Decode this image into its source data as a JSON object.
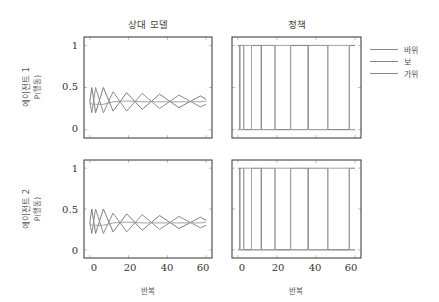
{
  "columns": {
    "left_title": "상대 모델",
    "right_title": "정책"
  },
  "rows": [
    {
      "label": "에이전트 1",
      "sublabel": "P(행동)"
    },
    {
      "label": "에이전트 2",
      "sublabel": "P(행동)"
    }
  ],
  "axes": {
    "y_ticks": [
      "1",
      "0.5",
      "0"
    ],
    "x_ticks": [
      "0",
      "20",
      "40",
      "60"
    ],
    "xlabel": "반복"
  },
  "legend": {
    "items": [
      {
        "label": "바위",
        "color": "#8a8a8a"
      },
      {
        "label": "보",
        "color": "#8a8a8a"
      },
      {
        "label": "가위",
        "color": "#8a8a8a"
      }
    ]
  },
  "chart_data": [
    {
      "type": "line",
      "title": "상대 모델",
      "row_label": "에이전트 1 P(행동)",
      "xlabel": "반복",
      "ylabel": "P(행동)",
      "xlim": [
        -3,
        63
      ],
      "ylim": [
        -0.1,
        1.1
      ],
      "x_ticks": [
        0,
        20,
        40,
        60
      ],
      "y_ticks": [
        0,
        0.5,
        1
      ],
      "grid": false,
      "legend_position": "right",
      "description": "Three opponent-model action probabilities oscillating around 1/3 with slowly decaying amplitude and increasing period (fictitious-play-like cycle).",
      "series": [
        {
          "name": "바위",
          "x": [
            0,
            1,
            3,
            7,
            12,
            19,
            27,
            36,
            46,
            57,
            60
          ],
          "y": [
            0.33,
            0.5,
            0.2,
            0.5,
            0.22,
            0.44,
            0.24,
            0.42,
            0.26,
            0.4,
            0.36
          ]
        },
        {
          "name": "보",
          "x": [
            0,
            1,
            3,
            7,
            12,
            19,
            27,
            36,
            46,
            57,
            60
          ],
          "y": [
            0.33,
            0.2,
            0.5,
            0.2,
            0.45,
            0.22,
            0.43,
            0.25,
            0.41,
            0.27,
            0.3
          ]
        },
        {
          "name": "가위",
          "x": [
            0,
            1,
            3,
            7,
            12,
            19,
            27,
            36,
            46,
            57,
            60
          ],
          "y": [
            0.33,
            0.3,
            0.3,
            0.3,
            0.33,
            0.34,
            0.33,
            0.33,
            0.33,
            0.33,
            0.34
          ]
        }
      ]
    },
    {
      "type": "line",
      "title": "정책",
      "row_label": "에이전트 1",
      "xlabel": "반복",
      "xlim": [
        -3,
        63
      ],
      "ylim": [
        -0.1,
        1.1
      ],
      "x_ticks": [
        0,
        20,
        40,
        60
      ],
      "y_ticks": [
        0,
        0.5,
        1
      ],
      "grid": false,
      "description": "Deterministic best-response policy: each action probability switches between 0 and 1; switch iterations approx.",
      "switch_iterations": [
        1,
        3,
        7,
        12,
        19,
        27,
        36,
        46,
        57
      ]
    },
    {
      "type": "line",
      "title": "상대 모델",
      "row_label": "에이전트 2 P(행동)",
      "xlabel": "반복",
      "ylabel": "P(행동)",
      "xlim": [
        -3,
        63
      ],
      "ylim": [
        -0.1,
        1.1
      ],
      "x_ticks": [
        0,
        20,
        40,
        60
      ],
      "y_ticks": [
        0,
        0.5,
        1
      ],
      "grid": false,
      "series": [
        {
          "name": "바위",
          "x": [
            0,
            1,
            3,
            7,
            12,
            19,
            27,
            36,
            46,
            57,
            60
          ],
          "y": [
            0.33,
            0.5,
            0.2,
            0.5,
            0.22,
            0.44,
            0.24,
            0.42,
            0.26,
            0.4,
            0.36
          ]
        },
        {
          "name": "보",
          "x": [
            0,
            1,
            3,
            7,
            12,
            19,
            27,
            36,
            46,
            57,
            60
          ],
          "y": [
            0.33,
            0.2,
            0.5,
            0.2,
            0.45,
            0.22,
            0.43,
            0.25,
            0.41,
            0.27,
            0.3
          ]
        },
        {
          "name": "가위",
          "x": [
            0,
            1,
            3,
            7,
            12,
            19,
            27,
            36,
            46,
            57,
            60
          ],
          "y": [
            0.33,
            0.3,
            0.3,
            0.3,
            0.33,
            0.34,
            0.33,
            0.33,
            0.33,
            0.33,
            0.34
          ]
        }
      ]
    },
    {
      "type": "line",
      "title": "정책",
      "row_label": "에이전트 2",
      "xlabel": "반복",
      "xlim": [
        -3,
        63
      ],
      "ylim": [
        -0.1,
        1.1
      ],
      "x_ticks": [
        0,
        20,
        40,
        60
      ],
      "y_ticks": [
        0,
        0.5,
        1
      ],
      "grid": false,
      "switch_iterations": [
        1,
        3,
        7,
        12,
        19,
        27,
        36,
        46,
        57
      ]
    }
  ]
}
